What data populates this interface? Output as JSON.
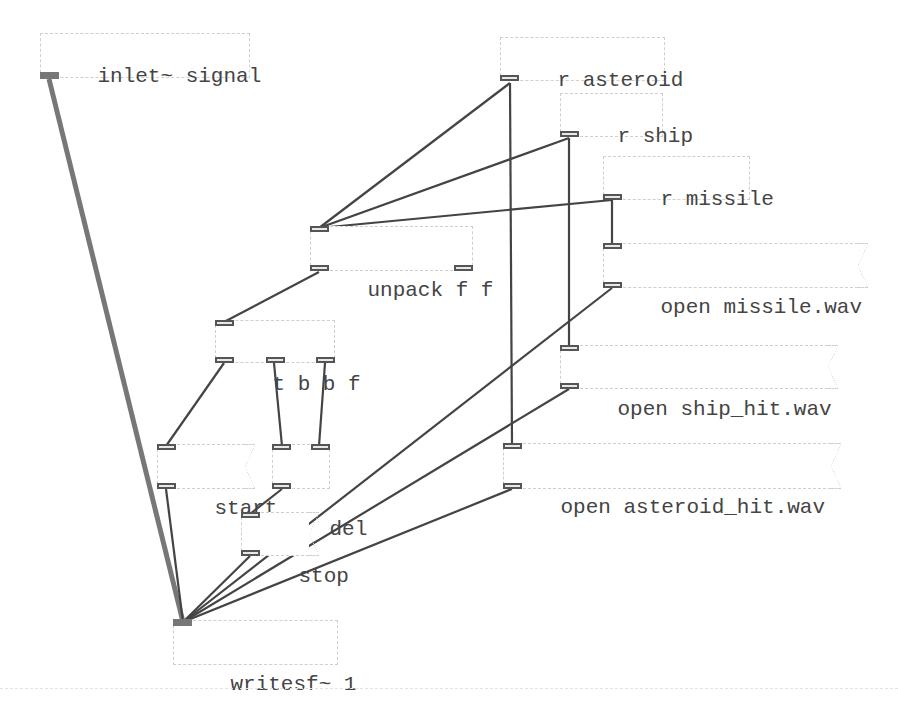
{
  "patch": {
    "objects": [
      {
        "id": "inlet",
        "type": "object",
        "text": "inlet~ signal"
      },
      {
        "id": "r_asteroid",
        "type": "object",
        "text": "r asteroid"
      },
      {
        "id": "r_ship",
        "type": "object",
        "text": "r ship"
      },
      {
        "id": "r_missile",
        "type": "object",
        "text": "r missile"
      },
      {
        "id": "msg_missile",
        "type": "message",
        "text": "open missile.wav"
      },
      {
        "id": "unpack",
        "type": "object",
        "text": "unpack f f"
      },
      {
        "id": "trigger",
        "type": "object",
        "text": "t b b f"
      },
      {
        "id": "msg_ship_hit",
        "type": "message",
        "text": "open ship_hit.wav"
      },
      {
        "id": "msg_start",
        "type": "message",
        "text": "start"
      },
      {
        "id": "del",
        "type": "object",
        "text": "del"
      },
      {
        "id": "msg_asteroid_hit",
        "type": "message",
        "text": "open asteroid_hit.wav"
      },
      {
        "id": "msg_stop",
        "type": "message",
        "text": "stop"
      },
      {
        "id": "writesf",
        "type": "object",
        "text": "writesf~ 1"
      }
    ],
    "connections": [
      {
        "from": "inlet~ signal:0",
        "to": "writesf~ 1:0",
        "kind": "signal"
      },
      {
        "from": "r asteroid:0",
        "to": "unpack f f:0",
        "kind": "control"
      },
      {
        "from": "r asteroid:0",
        "to": "open asteroid_hit.wav:0",
        "kind": "control"
      },
      {
        "from": "r ship:0",
        "to": "unpack f f:0",
        "kind": "control"
      },
      {
        "from": "r ship:0",
        "to": "open ship_hit.wav:0",
        "kind": "control"
      },
      {
        "from": "r missile:0",
        "to": "unpack f f:0",
        "kind": "control"
      },
      {
        "from": "r missile:0",
        "to": "open missile.wav:0",
        "kind": "control"
      },
      {
        "from": "unpack f f:0",
        "to": "t b b f:0",
        "kind": "control"
      },
      {
        "from": "t b b f:0",
        "to": "start:0",
        "kind": "control"
      },
      {
        "from": "t b b f:1",
        "to": "del:0",
        "kind": "control"
      },
      {
        "from": "t b b f:2",
        "to": "del:1",
        "kind": "control"
      },
      {
        "from": "del:0",
        "to": "stop:0",
        "kind": "control"
      },
      {
        "from": "start:0",
        "to": "writesf~ 1:0",
        "kind": "control"
      },
      {
        "from": "stop:0",
        "to": "writesf~ 1:0",
        "kind": "control"
      },
      {
        "from": "open missile.wav:0",
        "to": "writesf~ 1:0",
        "kind": "control"
      },
      {
        "from": "open ship_hit.wav:0",
        "to": "writesf~ 1:0",
        "kind": "control"
      },
      {
        "from": "open asteroid_hit.wav:0",
        "to": "writesf~ 1:0",
        "kind": "control"
      }
    ],
    "colors": {
      "wire_control": "#444444",
      "wire_signal": "#777777",
      "box_border": "#cfcfcf",
      "text": "#444444",
      "background": "#ffffff"
    }
  }
}
